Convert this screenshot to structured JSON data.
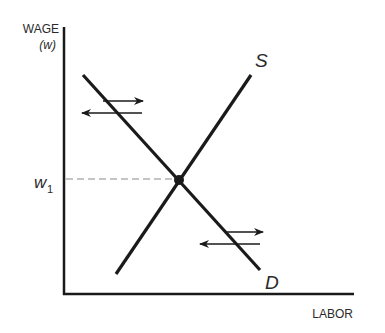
{
  "diagram": {
    "type": "supply-demand-labor-market",
    "y_axis": {
      "label_line1": "WAGE",
      "label_line2": "(w)"
    },
    "x_axis": {
      "label": "LABOR"
    },
    "equilibrium_wage_label": "w",
    "equilibrium_wage_subscript": "1",
    "supply_label": "S",
    "demand_label": "D",
    "colors": {
      "line": "#1a1a1a",
      "dashed": "#8a8a8a",
      "text": "#2a2a2a",
      "background": "#ffffff"
    }
  }
}
